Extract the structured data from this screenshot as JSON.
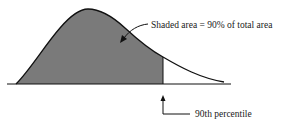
{
  "diagram": {
    "type": "right-skewed density curve",
    "shaded_fraction_percent": 90,
    "annotations": {
      "shaded_area": "Shaded area = 90% of total area",
      "percentile": "90th percentile"
    },
    "colors": {
      "shade": "#7a7a7a",
      "line": "#111111"
    }
  }
}
